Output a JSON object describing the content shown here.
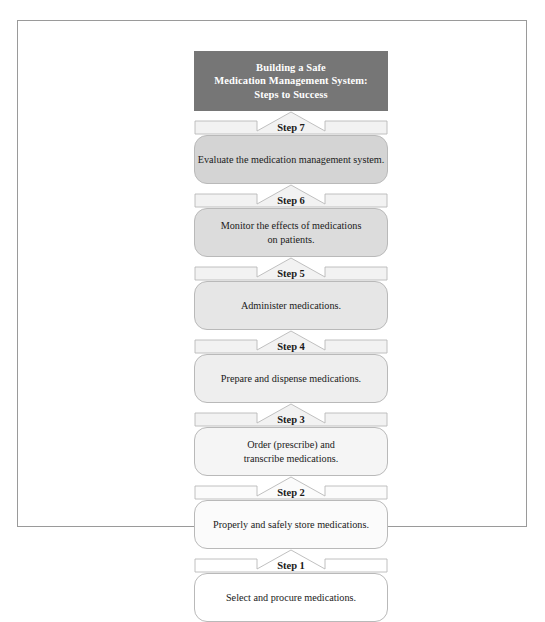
{
  "diagram": {
    "title_lines": [
      "Building a Safe",
      "Medication Management System:",
      "Steps to Success"
    ],
    "title_bg_color": "#767676",
    "title_text_color": "#ffffff",
    "frame_border_color": "#9a9a9a",
    "box_border_color": "#b9b9b9",
    "connector_fill_color": "#f2f2f2",
    "steps": [
      {
        "step_label": "Step 7",
        "text_lines": [
          "Evaluate the medication management system."
        ],
        "fill_color": "#d4d4d4",
        "height_class": "h-tall"
      },
      {
        "step_label": "Step 6",
        "text_lines": [
          "Monitor the effects of medications",
          "on patients."
        ],
        "fill_color": "#dcdcdc",
        "height_class": "h-tall"
      },
      {
        "step_label": "Step 5",
        "text_lines": [
          "Administer medications."
        ],
        "fill_color": "#e6e6e6",
        "height_class": "h-tall"
      },
      {
        "step_label": "Step 4",
        "text_lines": [
          "Prepare and dispense medications."
        ],
        "fill_color": "#eeeeee",
        "height_class": "h-tall"
      },
      {
        "step_label": "Step 3",
        "text_lines": [
          "Order (prescribe) and",
          "transcribe medications."
        ],
        "fill_color": "#f5f5f5",
        "height_class": "h-tall"
      },
      {
        "step_label": "Step 2",
        "text_lines": [
          "Properly and safely store medications."
        ],
        "fill_color": "#fbfbfb",
        "height_class": "h-tall"
      },
      {
        "step_label": "Step 1",
        "text_lines": [
          "Select and procure medications."
        ],
        "fill_color": "#ffffff",
        "height_class": "h-tall"
      }
    ]
  }
}
